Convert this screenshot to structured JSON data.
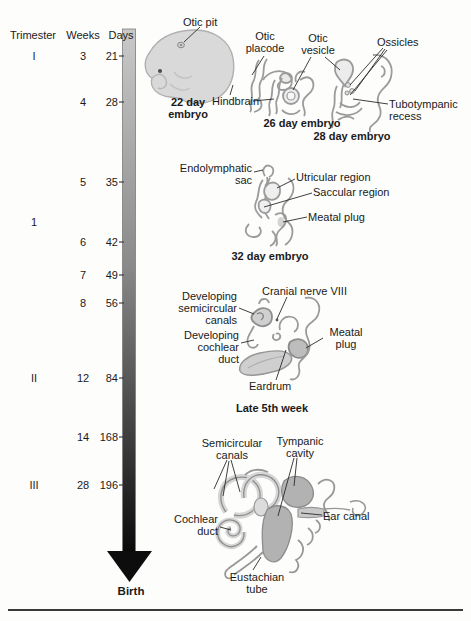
{
  "figure": {
    "table": {
      "headers": {
        "trimester": "Trimester",
        "weeks": "Weeks",
        "days": "Days"
      },
      "rows": [
        {
          "trimester": "I",
          "weeks": "3",
          "days": "21"
        },
        {
          "trimester": "",
          "weeks": "4",
          "days": "28"
        },
        {
          "trimester": "",
          "weeks": "5",
          "days": "35"
        },
        {
          "trimester": "1",
          "weeks": "",
          "days": ""
        },
        {
          "trimester": "",
          "weeks": "6",
          "days": "42"
        },
        {
          "trimester": "",
          "weeks": "7",
          "days": "49"
        },
        {
          "trimester": "",
          "weeks": "8",
          "days": "56"
        },
        {
          "trimester": "II",
          "weeks": "12",
          "days": "84"
        },
        {
          "trimester": "",
          "weeks": "14",
          "days": "168"
        },
        {
          "trimester": "III",
          "weeks": "28",
          "days": "196"
        }
      ]
    },
    "timeline": {
      "end_label": "Birth"
    },
    "captions": {
      "day22": "22 day embryo",
      "day26": "26 day embryo",
      "day28": "28 day embryo",
      "day32": "32 day embryo",
      "week5": "Late 5th week"
    },
    "labels": {
      "otic_pit": "Otic pit",
      "otic_placode": "Otic placode",
      "hindbrain": "Hindbrain",
      "otic_vesicle": "Otic vesicle",
      "ossicles": "Ossicles",
      "tubotympanic_recess": "Tubotympanic recess",
      "endolymphatic_sac": "Endolymphatic sac",
      "utricular_region": "Utricular region",
      "saccular_region": "Saccular region",
      "meatal_plug_32": "Meatal plug",
      "cranial_nerve_viii": "Cranial nerve VIII",
      "developing_semicircular_canals": "Developing semicircular canals",
      "developing_cochlear_duct": "Developing cochlear duct",
      "meatal_plug_5th": "Meatal plug",
      "eardrum": "Eardrum",
      "semicircular_canals": "Semicircular canals",
      "tympanic_cavity": "Tympanic cavity",
      "cochlear_duct": "Cochlear duct",
      "ear_canal": "Ear canal",
      "eustachian_tube": "Eustachian tube"
    },
    "colors": {
      "arrow_top": "#c9c9c9",
      "arrow_bottom": "#000000",
      "sketch_outline": "#9b9b9b",
      "sketch_fill": "#ececec",
      "shaded_fill": "#b2b2b2",
      "embryo_fill": "#d9d9d9"
    }
  }
}
